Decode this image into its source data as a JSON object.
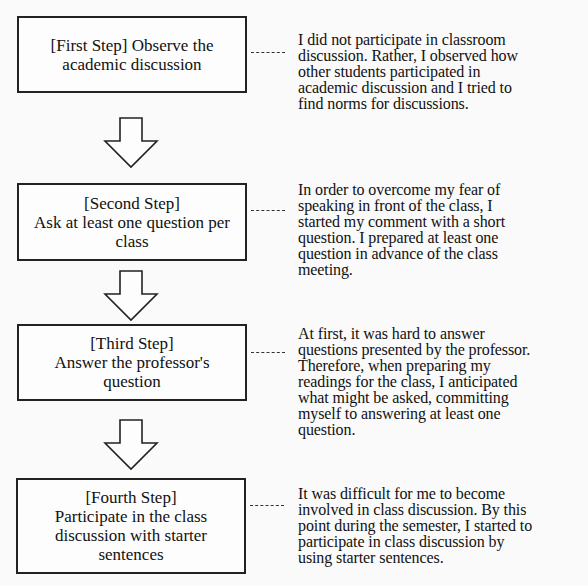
{
  "diagram": {
    "type": "vertical-flowchart",
    "steps": [
      {
        "label_lines": [
          "[First Step] Observe the",
          "academic discussion"
        ],
        "description": "I did not participate in classroom discussion. Rather, I observed how other students participated in academic discussion and I tried to find norms for discussions.",
        "description_lines": [
          "I did not participate in classroom",
          "discussion. Rather, I observed how",
          "other students participated in",
          "academic discussion and I tried to",
          "find norms for discussions."
        ]
      },
      {
        "label_lines": [
          "[Second Step]",
          "Ask at least one question per",
          "class"
        ],
        "description": "In order to overcome my fear of speaking in front of the class, I started my comment with a short question. I prepared at least one question in advance of the class meeting.",
        "description_lines": [
          "In order to overcome my fear of",
          "speaking in front of the class, I",
          "started my comment with a short",
          "question. I prepared at least one",
          "question in advance of the class",
          "meeting."
        ]
      },
      {
        "label_lines": [
          "[Third Step]",
          "Answer the professor's",
          "question"
        ],
        "description": "At first, it was hard to answer questions presented by the professor. Therefore, when preparing my readings for the class, I anticipated what might be asked, committing myself to answering at least one question.",
        "description_lines": [
          "At first, it was hard to answer",
          "questions presented by the professor.",
          "Therefore, when preparing my",
          "readings for the class, I anticipated",
          "what might be asked, committing",
          "myself to answering at least one",
          "question."
        ]
      },
      {
        "label_lines": [
          "[Fourth Step]",
          "Participate in the class",
          "discussion with starter",
          "sentences"
        ],
        "description": "It was difficult for me to become involved in class discussion. By this point during the semester, I started to participate in class discussion by using starter sentences.",
        "description_lines": [
          "It was difficult for me to become",
          "involved in class discussion. By this",
          "point during the semester, I started to",
          "participate in class discussion by",
          "using starter sentences."
        ]
      }
    ],
    "arrows": [
      {
        "from": 1,
        "to": 2,
        "icon": "hollow-down-arrow-icon"
      },
      {
        "from": 2,
        "to": 3,
        "icon": "hollow-down-arrow-icon"
      },
      {
        "from": 3,
        "to": 4,
        "icon": "hollow-down-arrow-icon"
      }
    ],
    "colors": {
      "stroke": "#222222",
      "background": "#fafafa"
    }
  }
}
